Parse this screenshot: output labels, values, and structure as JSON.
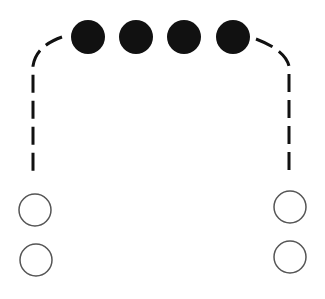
{
  "diagram": {
    "width": 325,
    "height": 299,
    "background": "#ffffff",
    "stroke_color": "#111111",
    "open_circle_color": "#555555",
    "filled_circles": [
      {
        "cx": 88,
        "cy": 37,
        "r": 17
      },
      {
        "cx": 136,
        "cy": 37,
        "r": 17
      },
      {
        "cx": 184,
        "cy": 37,
        "r": 17
      },
      {
        "cx": 233,
        "cy": 37,
        "r": 17
      }
    ],
    "dashed_paths": [
      {
        "name": "left-dashed-path",
        "d": "M 62 37 Q 36 46 33 66 L 33 174"
      },
      {
        "name": "right-dashed-path",
        "d": "M 256 39 Q 285 50 289 66 L 289 174"
      }
    ],
    "open_circles": [
      {
        "cx": 35,
        "cy": 210,
        "r": 16
      },
      {
        "cx": 36,
        "cy": 260,
        "r": 16
      },
      {
        "cx": 290,
        "cy": 207,
        "r": 16
      },
      {
        "cx": 290,
        "cy": 257,
        "r": 16
      }
    ]
  }
}
